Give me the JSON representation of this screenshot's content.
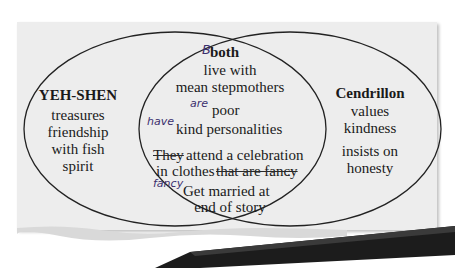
{
  "diagram": {
    "type": "venn",
    "colors": {
      "paper": "#ededed",
      "ink": "#1a1a1a",
      "edits": "#3b2f6e",
      "pencil": "#1c1c1c"
    },
    "left": {
      "title": "YEH-SHEN",
      "items": [
        "treasures",
        "friendship",
        "with fish",
        "spirit"
      ]
    },
    "right": {
      "title": "Cendrillon",
      "items": [
        "values",
        "kindness",
        "insists on",
        "honesty"
      ]
    },
    "center": {
      "title": "both",
      "title_edit": "B",
      "lines": {
        "l1": "live with",
        "l2": "mean stepmothers",
        "l3": "poor",
        "l3_insert": "are",
        "l4": "kind personalities",
        "l4_insert": "have",
        "l5_struck": "They",
        "l5": "attend a celebration",
        "l6_pre": "in",
        "l6": "clothes",
        "l6_struck": "that are fancy",
        "l6_end": ".",
        "l6_insert": "fancy",
        "l7": "Get married at",
        "l7_edit": "g",
        "l8": "end of story"
      }
    }
  }
}
